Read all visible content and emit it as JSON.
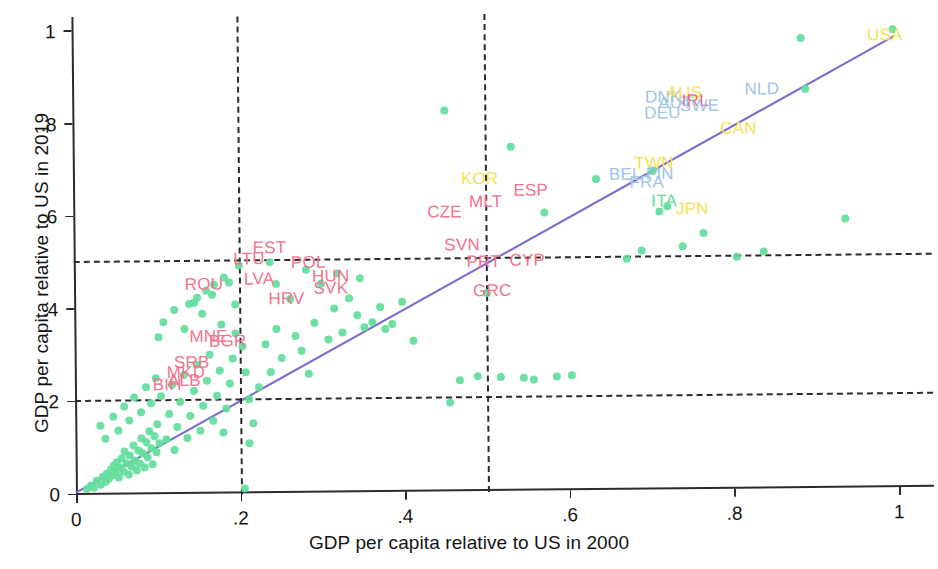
{
  "chart_data": {
    "type": "scatter",
    "title": "",
    "xlabel": "GDP per capita relative to US in 2000",
    "ylabel": "GDP per capita relative to US in 2019",
    "xlim": [
      0,
      1.04
    ],
    "ylim": [
      0,
      1.03
    ],
    "xticks": [
      "0",
      ".2",
      ".4",
      ".6",
      ".8",
      "1"
    ],
    "xtickvalues": [
      0,
      0.2,
      0.4,
      0.6,
      0.8,
      1
    ],
    "yticks": [
      "0",
      ".2",
      ".4",
      ".6",
      ".8",
      "1"
    ],
    "ytickvalues": [
      0,
      0.2,
      0.4,
      0.6,
      0.8,
      1
    ],
    "grid": false,
    "legend": "none",
    "marker_color": "#63dd9b",
    "fitline_color": "#7a6fd0",
    "reference_line_color": "#2b2b2b",
    "reference_lines": {
      "vertical": [
        0.2,
        0.5
      ],
      "horizontal": [
        0.2,
        0.5
      ]
    },
    "fitline": {
      "x0": 0.0,
      "y0": 0.005,
      "x1": 1.0,
      "y1": 0.975
    },
    "labels": [
      {
        "code": "EST",
        "x": 0.238,
        "y": 0.528,
        "color": "#f2738c"
      },
      {
        "code": "LTU",
        "x": 0.213,
        "y": 0.505,
        "color": "#f2738c"
      },
      {
        "code": "POL",
        "x": 0.285,
        "y": 0.497,
        "color": "#f2738c"
      },
      {
        "code": "LVA",
        "x": 0.225,
        "y": 0.463,
        "color": "#f2738c"
      },
      {
        "code": "HUN",
        "x": 0.312,
        "y": 0.466,
        "color": "#f2738c"
      },
      {
        "code": "SVK",
        "x": 0.312,
        "y": 0.44,
        "color": "#f2738c"
      },
      {
        "code": "ROU",
        "x": 0.158,
        "y": 0.451,
        "color": "#f2738c"
      },
      {
        "code": "HRV",
        "x": 0.258,
        "y": 0.419,
        "color": "#f2738c"
      },
      {
        "code": "MNE",
        "x": 0.163,
        "y": 0.339,
        "color": "#f2738c"
      },
      {
        "code": "BGR",
        "x": 0.186,
        "y": 0.329,
        "color": "#f2738c"
      },
      {
        "code": "SRB",
        "x": 0.142,
        "y": 0.283,
        "color": "#f2738c"
      },
      {
        "code": "MKD",
        "x": 0.135,
        "y": 0.261,
        "color": "#f2738c"
      },
      {
        "code": "ALB",
        "x": 0.133,
        "y": 0.243,
        "color": "#f2738c"
      },
      {
        "code": "BIH",
        "x": 0.112,
        "y": 0.235,
        "color": "#f2738c"
      },
      {
        "code": "CZE",
        "x": 0.451,
        "y": 0.602,
        "color": "#f2738c"
      },
      {
        "code": "MLT",
        "x": 0.501,
        "y": 0.625,
        "color": "#f2738c"
      },
      {
        "code": "KOR",
        "x": 0.494,
        "y": 0.673,
        "color": "#f7df55"
      },
      {
        "code": "ESP",
        "x": 0.556,
        "y": 0.648,
        "color": "#f2738c"
      },
      {
        "code": "SVN",
        "x": 0.472,
        "y": 0.532,
        "color": "#f2738c"
      },
      {
        "code": "PRT",
        "x": 0.498,
        "y": 0.495,
        "color": "#f2738c"
      },
      {
        "code": "CYP",
        "x": 0.551,
        "y": 0.497,
        "color": "#f2738c"
      },
      {
        "code": "GRC",
        "x": 0.508,
        "y": 0.432,
        "color": "#f2738c"
      },
      {
        "code": "DNK",
        "x": 0.718,
        "y": 0.847,
        "color": "#9fc4ea"
      },
      {
        "code": "AUS",
        "x": 0.744,
        "y": 0.855,
        "color": "#f7df55"
      },
      {
        "code": "AUT",
        "x": 0.733,
        "y": 0.833,
        "color": "#9fc4ea"
      },
      {
        "code": "IRL",
        "x": 0.757,
        "y": 0.838,
        "color": "#ef6a7a"
      },
      {
        "code": "SWE",
        "x": 0.762,
        "y": 0.828,
        "color": "#9fc4ea"
      },
      {
        "code": "DEU",
        "x": 0.717,
        "y": 0.812,
        "color": "#9fc4ea"
      },
      {
        "code": "NLD",
        "x": 0.838,
        "y": 0.862,
        "color": "#9fc4ea"
      },
      {
        "code": "CAN",
        "x": 0.809,
        "y": 0.778,
        "color": "#f7df55"
      },
      {
        "code": "TWN",
        "x": 0.706,
        "y": 0.705,
        "color": "#f7df55"
      },
      {
        "code": "BEL",
        "x": 0.671,
        "y": 0.681,
        "color": "#9fc4ea"
      },
      {
        "code": "FIN",
        "x": 0.713,
        "y": 0.681,
        "color": "#9fc4ea"
      },
      {
        "code": "FRA",
        "x": 0.697,
        "y": 0.663,
        "color": "#9fc4ea"
      },
      {
        "code": "ITA",
        "x": 0.718,
        "y": 0.621,
        "color": "#63dd9b"
      },
      {
        "code": "JPN",
        "x": 0.752,
        "y": 0.604,
        "color": "#f7df55"
      },
      {
        "code": "USA",
        "x": 0.988,
        "y": 0.977,
        "color": "#f7df55"
      }
    ],
    "points": [
      [
        0.013,
        0.012
      ],
      [
        0.018,
        0.02
      ],
      [
        0.022,
        0.016
      ],
      [
        0.026,
        0.03
      ],
      [
        0.03,
        0.022
      ],
      [
        0.033,
        0.038
      ],
      [
        0.036,
        0.028
      ],
      [
        0.038,
        0.046
      ],
      [
        0.04,
        0.034
      ],
      [
        0.042,
        0.055
      ],
      [
        0.044,
        0.041
      ],
      [
        0.046,
        0.062
      ],
      [
        0.048,
        0.048
      ],
      [
        0.05,
        0.07
      ],
      [
        0.052,
        0.036
      ],
      [
        0.054,
        0.058
      ],
      [
        0.056,
        0.078
      ],
      [
        0.058,
        0.05
      ],
      [
        0.06,
        0.092
      ],
      [
        0.062,
        0.066
      ],
      [
        0.064,
        0.044
      ],
      [
        0.066,
        0.084
      ],
      [
        0.068,
        0.06
      ],
      [
        0.07,
        0.106
      ],
      [
        0.072,
        0.074
      ],
      [
        0.074,
        0.052
      ],
      [
        0.076,
        0.096
      ],
      [
        0.078,
        0.068
      ],
      [
        0.08,
        0.12
      ],
      [
        0.082,
        0.088
      ],
      [
        0.084,
        0.058
      ],
      [
        0.086,
        0.112
      ],
      [
        0.088,
        0.08
      ],
      [
        0.09,
        0.136
      ],
      [
        0.092,
        0.1
      ],
      [
        0.094,
        0.064
      ],
      [
        0.096,
        0.126
      ],
      [
        0.098,
        0.09
      ],
      [
        0.1,
        0.152
      ],
      [
        0.102,
        0.11
      ],
      [
        0.03,
        0.148
      ],
      [
        0.037,
        0.122
      ],
      [
        0.046,
        0.168
      ],
      [
        0.052,
        0.138
      ],
      [
        0.06,
        0.19
      ],
      [
        0.065,
        0.16
      ],
      [
        0.072,
        0.21
      ],
      [
        0.08,
        0.178
      ],
      [
        0.086,
        0.232
      ],
      [
        0.092,
        0.196
      ],
      [
        0.098,
        0.25
      ],
      [
        0.105,
        0.212
      ],
      [
        0.11,
        0.118
      ],
      [
        0.114,
        0.172
      ],
      [
        0.118,
        0.235
      ],
      [
        0.12,
        0.095
      ],
      [
        0.124,
        0.145
      ],
      [
        0.128,
        0.198
      ],
      [
        0.132,
        0.256
      ],
      [
        0.136,
        0.12
      ],
      [
        0.14,
        0.168
      ],
      [
        0.144,
        0.222
      ],
      [
        0.148,
        0.278
      ],
      [
        0.152,
        0.136
      ],
      [
        0.156,
        0.19
      ],
      [
        0.16,
        0.244
      ],
      [
        0.164,
        0.3
      ],
      [
        0.168,
        0.158
      ],
      [
        0.172,
        0.212
      ],
      [
        0.176,
        0.266
      ],
      [
        0.18,
        0.132
      ],
      [
        0.184,
        0.184
      ],
      [
        0.188,
        0.238
      ],
      [
        0.192,
        0.292
      ],
      [
        0.196,
        0.346
      ],
      [
        0.102,
        0.34
      ],
      [
        0.108,
        0.372
      ],
      [
        0.122,
        0.398
      ],
      [
        0.134,
        0.356
      ],
      [
        0.146,
        0.412
      ],
      [
        0.155,
        0.388
      ],
      [
        0.168,
        0.43
      ],
      [
        0.178,
        0.366
      ],
      [
        0.188,
        0.456
      ],
      [
        0.196,
        0.408
      ],
      [
        0.2,
        0.492
      ],
      [
        0.204,
        0.318
      ],
      [
        0.208,
        0.262
      ],
      [
        0.212,
        0.204
      ],
      [
        0.216,
        0.152
      ],
      [
        0.182,
        0.466
      ],
      [
        0.17,
        0.452
      ],
      [
        0.16,
        0.438
      ],
      [
        0.15,
        0.424
      ],
      [
        0.14,
        0.41
      ],
      [
        0.205,
        0.01
      ],
      [
        0.212,
        0.108
      ],
      [
        0.224,
        0.23
      ],
      [
        0.232,
        0.322
      ],
      [
        0.238,
        0.262
      ],
      [
        0.246,
        0.354
      ],
      [
        0.252,
        0.292
      ],
      [
        0.262,
        0.418
      ],
      [
        0.268,
        0.34
      ],
      [
        0.276,
        0.306
      ],
      [
        0.284,
        0.258
      ],
      [
        0.292,
        0.368
      ],
      [
        0.3,
        0.452
      ],
      [
        0.308,
        0.33
      ],
      [
        0.316,
        0.398
      ],
      [
        0.326,
        0.346
      ],
      [
        0.334,
        0.42
      ],
      [
        0.344,
        0.382
      ],
      [
        0.352,
        0.356
      ],
      [
        0.362,
        0.368
      ],
      [
        0.372,
        0.4
      ],
      [
        0.378,
        0.352
      ],
      [
        0.386,
        0.362
      ],
      [
        0.398,
        0.41
      ],
      [
        0.412,
        0.326
      ],
      [
        0.246,
        0.452
      ],
      [
        0.282,
        0.482
      ],
      [
        0.32,
        0.474
      ],
      [
        0.348,
        0.462
      ],
      [
        0.238,
        0.498
      ],
      [
        0.452,
        0.822
      ],
      [
        0.456,
        0.192
      ],
      [
        0.468,
        0.24
      ],
      [
        0.49,
        0.248
      ],
      [
        0.502,
        0.428
      ],
      [
        0.518,
        0.246
      ],
      [
        0.532,
        0.742
      ],
      [
        0.545,
        0.244
      ],
      [
        0.558,
        0.24
      ],
      [
        0.572,
        0.6
      ],
      [
        0.585,
        0.246
      ],
      [
        0.604,
        0.248
      ],
      [
        0.636,
        0.672
      ],
      [
        0.672,
        0.498
      ],
      [
        0.69,
        0.516
      ],
      [
        0.705,
        0.688
      ],
      [
        0.712,
        0.6
      ],
      [
        0.722,
        0.612
      ],
      [
        0.74,
        0.524
      ],
      [
        0.766,
        0.552
      ],
      [
        0.806,
        0.502
      ],
      [
        0.838,
        0.512
      ],
      [
        0.886,
        0.972
      ],
      [
        0.89,
        0.862
      ],
      [
        0.938,
        0.58
      ],
      [
        0.998,
        0.99
      ]
    ]
  }
}
